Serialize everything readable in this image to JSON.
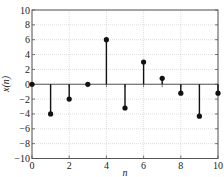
{
  "chart_data": {
    "type": "stem",
    "title": "",
    "xlabel": "n",
    "ylabel": "x(n)",
    "x": [
      0,
      1,
      2,
      3,
      4,
      5,
      6,
      7,
      8,
      9,
      10
    ],
    "values": [
      0,
      -4,
      -2,
      0,
      6,
      -3.2,
      3,
      0.8,
      -1.2,
      -4.3,
      -1.2
    ],
    "xlim": [
      0,
      10
    ],
    "ylim": [
      -10,
      10
    ],
    "xticks": [
      0,
      2,
      4,
      6,
      8,
      10
    ],
    "yticks": [
      -10,
      -8,
      -6,
      -4,
      -2,
      0,
      2,
      4,
      6,
      8,
      10
    ],
    "grid": true,
    "legend": null,
    "colors": {
      "stem": "#111111",
      "grid": "#c8c8c8",
      "axes": "#555555"
    }
  }
}
